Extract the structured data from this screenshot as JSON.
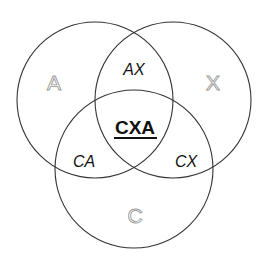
{
  "diagram": {
    "type": "venn-3",
    "colors": {
      "stroke": "#333333",
      "set_label_outline": "#9a9a9a",
      "text": "#111111",
      "background": "#ffffff"
    },
    "sets": [
      {
        "id": "A",
        "label": "A"
      },
      {
        "id": "X",
        "label": "X"
      },
      {
        "id": "C",
        "label": "C"
      }
    ],
    "intersections": {
      "AX": "AX",
      "CA": "CA",
      "CX": "CX",
      "CXA": "CXA"
    }
  }
}
